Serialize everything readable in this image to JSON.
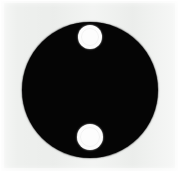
{
  "figure": {
    "name": "black-disc-with-two-white-holes",
    "canvas": {
      "width_px": 179,
      "height_px": 172,
      "background_color": "#eef0ee",
      "border_color": "#f7f8f7"
    },
    "shapes": [
      {
        "id": "main-disc",
        "type": "circle",
        "fill_color": "#050505",
        "center_x": 90,
        "center_y": 90,
        "diameter_px": 136
      },
      {
        "id": "upper-hole",
        "type": "circle",
        "fill_color": "#fdfdfd",
        "center_x": 90,
        "center_y": 37,
        "diameter_px": 24
      },
      {
        "id": "lower-hole",
        "type": "circle",
        "fill_color": "#fdfdfd",
        "center_x": 90,
        "center_y": 137,
        "diameter_px": 26
      }
    ]
  }
}
